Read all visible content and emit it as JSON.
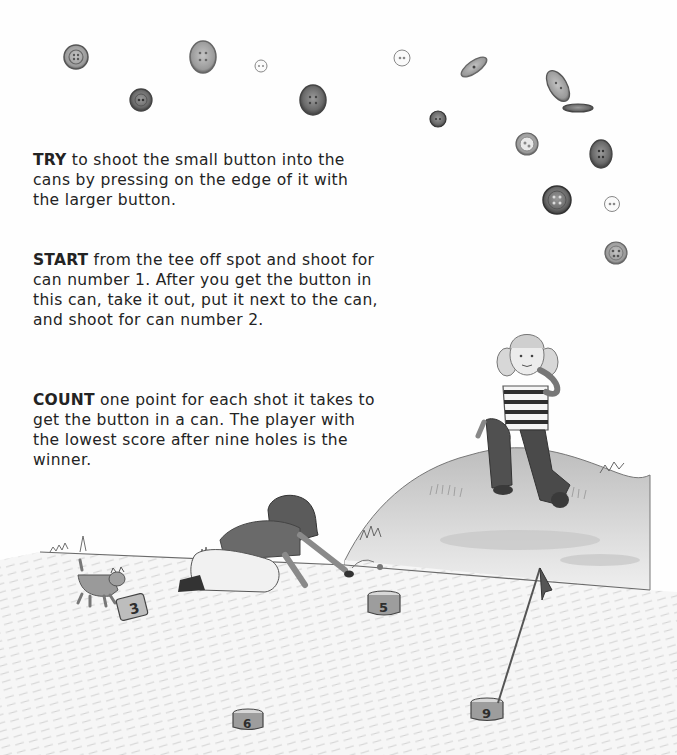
{
  "instructions": [
    {
      "lead": "TRY",
      "text": " to shoot the small button into the cans by pressing on the edge of it with the larger button."
    },
    {
      "lead": "START",
      "text": " from the tee off spot and shoot for can number 1. After you get the button in this can, take it out, put it next to the can, and shoot for can number 2."
    },
    {
      "lead": "COUNT",
      "text": " one point for each shot it takes to get the button in a can. The player with the lowest score after nine holes is the winner."
    }
  ],
  "illustration": {
    "scene": "Two girls playing button golf on a grassy field; one kneeling to shoot a button, one sitting on a hill; a kitten nearby; numbered tin cans as holes and a flag",
    "cans": [
      {
        "label": "3"
      },
      {
        "label": "5"
      },
      {
        "label": "6"
      },
      {
        "label": "9"
      }
    ],
    "colors": {
      "pencil_dark": "#4a4a4a",
      "pencil_mid": "#8a8a8a",
      "pencil_light": "#c8c8c8",
      "paper": "#fefefe"
    }
  }
}
